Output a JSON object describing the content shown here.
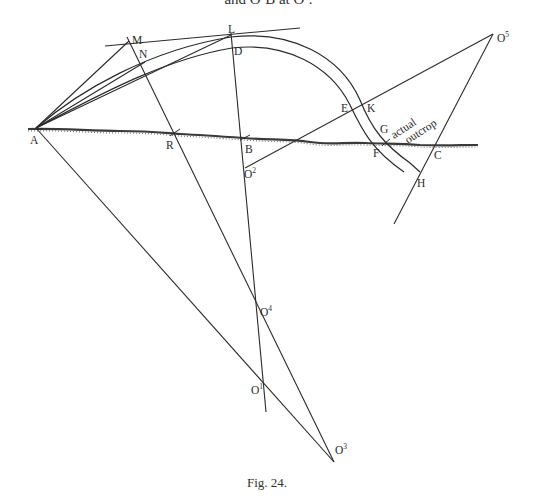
{
  "header": {
    "caption_fragment": "and O²B at O³."
  },
  "figure": {
    "caption": "Fig. 24.",
    "annotation": "actual outcrop",
    "annotation_line1": "actual",
    "annotation_line2": "outcrop",
    "labels": {
      "A": "A",
      "R": "R",
      "B": "B",
      "F": "F",
      "G": "G",
      "C": "C",
      "M": "M",
      "N": "N",
      "L": "L",
      "D": "D",
      "E": "E",
      "K": "K",
      "H": "H",
      "O": "O",
      "sup1": "1",
      "sup2": "2",
      "sup3": "3",
      "sup4": "4",
      "sup5": "5"
    }
  },
  "colors": {
    "line": "#2b2b2b",
    "ground": "#3a3a3a",
    "background": "#ffffff"
  }
}
